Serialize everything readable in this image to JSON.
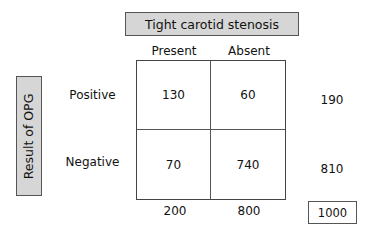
{
  "diagram": {
    "type": "2x2 contingency table",
    "column_header": "Tight carotid stenosis",
    "row_header": "Result of OPG",
    "columns": [
      "Present",
      "Absent"
    ],
    "rows": [
      {
        "label": "Positive",
        "values": [
          "130",
          "60"
        ],
        "total": "190"
      },
      {
        "label": "Negative",
        "values": [
          "70",
          "740"
        ],
        "total": "810"
      }
    ],
    "column_totals": [
      "200",
      "800"
    ],
    "grand_total": "1000"
  },
  "colors": {
    "header_fill": "#d6d6d6",
    "border": "#555555",
    "background": "#ffffff",
    "text": "#111111"
  }
}
